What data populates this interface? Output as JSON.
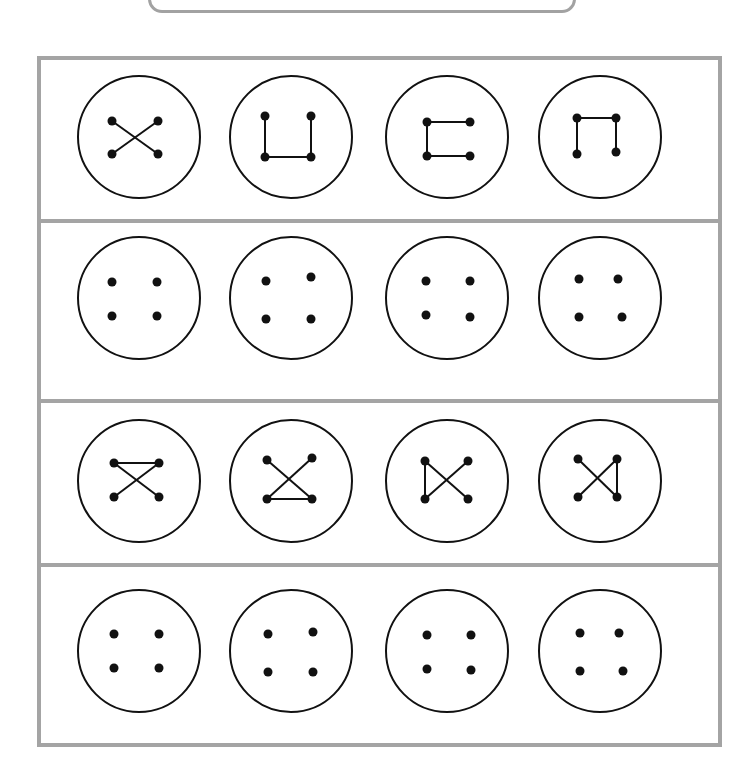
{
  "page": {
    "colors": {
      "frame": "#a4a4a4",
      "stroke": "#111111",
      "dot": "#111111",
      "background": "#ffffff"
    }
  },
  "top_box": {
    "label": ""
  },
  "grid": {
    "rows": 4,
    "columns": 4,
    "row_dividers_y": [
      219,
      399,
      563
    ],
    "column_centers_x": [
      139,
      291,
      447,
      600
    ],
    "row_centers_y": [
      137,
      298,
      481,
      651
    ],
    "circle_radius": 61
  },
  "rows": [
    {
      "id": "row-1",
      "type": "pattern",
      "buttons": [
        {
          "shape": "X",
          "dots": {
            "tl": [
              -27,
              -16
            ],
            "tr": [
              19,
              -16
            ],
            "bl": [
              -27,
              17
            ],
            "br": [
              19,
              17
            ]
          },
          "edges": [
            [
              "tl",
              "br"
            ],
            [
              "tr",
              "bl"
            ]
          ]
        },
        {
          "shape": "U",
          "dots": {
            "tl": [
              -26,
              -21
            ],
            "tr": [
              20,
              -21
            ],
            "bl": [
              -26,
              20
            ],
            "br": [
              20,
              20
            ]
          },
          "edges": [
            [
              "tl",
              "bl"
            ],
            [
              "bl",
              "br"
            ],
            [
              "br",
              "tr"
            ]
          ]
        },
        {
          "shape": "C",
          "dots": {
            "tl": [
              -20,
              -15
            ],
            "tr": [
              23,
              -15
            ],
            "bl": [
              -20,
              19
            ],
            "br": [
              23,
              19
            ]
          },
          "edges": [
            [
              "tr",
              "tl"
            ],
            [
              "tl",
              "bl"
            ],
            [
              "bl",
              "br"
            ]
          ]
        },
        {
          "shape": "n",
          "dots": {
            "tl": [
              -23,
              -19
            ],
            "tr": [
              16,
              -19
            ],
            "bl": [
              -23,
              17
            ],
            "br": [
              16,
              15
            ]
          },
          "edges": [
            [
              "bl",
              "tl"
            ],
            [
              "tl",
              "tr"
            ],
            [
              "tr",
              "br"
            ]
          ]
        }
      ]
    },
    {
      "id": "row-2",
      "type": "blank",
      "buttons": [
        {
          "shape": "dots",
          "dots": {
            "tl": [
              -27,
              -16
            ],
            "tr": [
              18,
              -16
            ],
            "bl": [
              -27,
              18
            ],
            "br": [
              18,
              18
            ]
          },
          "edges": []
        },
        {
          "shape": "dots",
          "dots": {
            "tl": [
              -25,
              -17
            ],
            "tr": [
              20,
              -21
            ],
            "bl": [
              -25,
              21
            ],
            "br": [
              20,
              21
            ]
          },
          "edges": []
        },
        {
          "shape": "dots",
          "dots": {
            "tl": [
              -21,
              -17
            ],
            "tr": [
              23,
              -17
            ],
            "bl": [
              -21,
              17
            ],
            "br": [
              23,
              19
            ]
          },
          "edges": []
        },
        {
          "shape": "dots",
          "dots": {
            "tl": [
              -21,
              -19
            ],
            "tr": [
              18,
              -19
            ],
            "bl": [
              -21,
              19
            ],
            "br": [
              22,
              19
            ]
          },
          "edges": []
        }
      ]
    },
    {
      "id": "row-3",
      "type": "pattern",
      "buttons": [
        {
          "shape": "top-bar-X",
          "dots": {
            "tl": [
              -25,
              -18
            ],
            "tr": [
              20,
              -18
            ],
            "bl": [
              -25,
              16
            ],
            "br": [
              20,
              16
            ]
          },
          "edges": [
            [
              "tl",
              "tr"
            ],
            [
              "tl",
              "br"
            ],
            [
              "tr",
              "bl"
            ]
          ]
        },
        {
          "shape": "bottom-bar-X",
          "dots": {
            "tl": [
              -24,
              -21
            ],
            "tr": [
              21,
              -23
            ],
            "bl": [
              -24,
              18
            ],
            "br": [
              21,
              18
            ]
          },
          "edges": [
            [
              "tl",
              "br"
            ],
            [
              "tr",
              "bl"
            ],
            [
              "bl",
              "br"
            ]
          ]
        },
        {
          "shape": "left-bar-X",
          "dots": {
            "tl": [
              -22,
              -20
            ],
            "tr": [
              21,
              -20
            ],
            "bl": [
              -22,
              18
            ],
            "br": [
              21,
              18
            ]
          },
          "edges": [
            [
              "tl",
              "bl"
            ],
            [
              "tl",
              "br"
            ],
            [
              "tr",
              "bl"
            ]
          ]
        },
        {
          "shape": "right-bar-X",
          "dots": {
            "tl": [
              -22,
              -22
            ],
            "tr": [
              17,
              -22
            ],
            "bl": [
              -22,
              16
            ],
            "br": [
              17,
              16
            ]
          },
          "edges": [
            [
              "tl",
              "br"
            ],
            [
              "tr",
              "bl"
            ],
            [
              "tr",
              "br"
            ]
          ]
        }
      ]
    },
    {
      "id": "row-4",
      "type": "blank",
      "buttons": [
        {
          "shape": "dots",
          "dots": {
            "tl": [
              -25,
              -17
            ],
            "tr": [
              20,
              -17
            ],
            "bl": [
              -25,
              17
            ],
            "br": [
              20,
              17
            ]
          },
          "edges": []
        },
        {
          "shape": "dots",
          "dots": {
            "tl": [
              -23,
              -17
            ],
            "tr": [
              22,
              -19
            ],
            "bl": [
              -23,
              21
            ],
            "br": [
              22,
              21
            ]
          },
          "edges": []
        },
        {
          "shape": "dots",
          "dots": {
            "tl": [
              -20,
              -16
            ],
            "tr": [
              24,
              -16
            ],
            "bl": [
              -20,
              18
            ],
            "br": [
              24,
              19
            ]
          },
          "edges": []
        },
        {
          "shape": "dots",
          "dots": {
            "tl": [
              -20,
              -18
            ],
            "tr": [
              19,
              -18
            ],
            "bl": [
              -20,
              20
            ],
            "br": [
              23,
              20
            ]
          },
          "edges": []
        }
      ]
    }
  ]
}
